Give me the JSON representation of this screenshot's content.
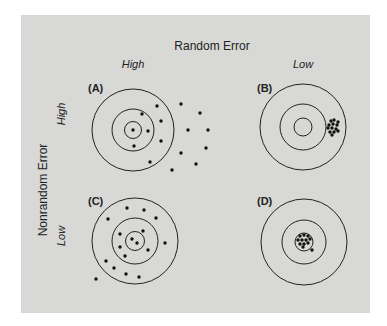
{
  "figure": {
    "column_header": "Random Error",
    "row_header": "Nonrandom Error",
    "columns": [
      {
        "label": "High",
        "x": 133,
        "y": 67
      },
      {
        "label": "Low",
        "x": 303,
        "y": 67
      }
    ],
    "rows": [
      {
        "label": "High",
        "x": 62,
        "y": 114
      },
      {
        "label": "Low",
        "x": 62,
        "y": 236
      }
    ],
    "colors": {
      "background": "#d8d8d6",
      "ink": "#222222"
    },
    "panels": [
      {
        "id": "A",
        "label": "(A)",
        "label_x": 88,
        "label_y": 92,
        "cx": 133,
        "cy": 130,
        "radii": [
          41,
          21,
          8.5
        ],
        "dots": [
          [
            157,
            106
          ],
          [
            181,
            104
          ],
          [
            142,
            114
          ],
          [
            200,
            113
          ],
          [
            161,
            121
          ],
          [
            133,
            130
          ],
          [
            148,
            131
          ],
          [
            188,
            130
          ],
          [
            208,
            130
          ],
          [
            161,
            141
          ],
          [
            134,
            146
          ],
          [
            206,
            148
          ],
          [
            181,
            153
          ],
          [
            150,
            162
          ],
          [
            196,
            164
          ],
          [
            172,
            170
          ]
        ]
      },
      {
        "id": "B",
        "label": "(B)",
        "label_x": 257,
        "label_y": 92,
        "cx": 303,
        "cy": 127,
        "radii": [
          43,
          23,
          9
        ],
        "dots": [
          [
            331,
            121
          ],
          [
            334,
            120
          ],
          [
            338,
            122
          ],
          [
            329,
            125
          ],
          [
            333,
            124
          ],
          [
            337,
            125
          ],
          [
            328,
            128
          ],
          [
            332,
            128
          ],
          [
            336,
            129
          ],
          [
            330,
            132
          ],
          [
            334,
            132
          ],
          [
            338,
            131
          ],
          [
            332,
            135
          ]
        ]
      },
      {
        "id": "C",
        "label": "(C)",
        "label_x": 88,
        "label_y": 205,
        "cx": 135,
        "cy": 241,
        "radii": [
          43,
          23,
          9.5
        ],
        "dots": [
          [
            127,
            208
          ],
          [
            144,
            210
          ],
          [
            108,
            219
          ],
          [
            156,
            218
          ],
          [
            143,
            231
          ],
          [
            120,
            234
          ],
          [
            132,
            239
          ],
          [
            137,
            243
          ],
          [
            165,
            243
          ],
          [
            120,
            247
          ],
          [
            148,
            250
          ],
          [
            125,
            256
          ],
          [
            106,
            261
          ],
          [
            114,
            268
          ],
          [
            126,
            274
          ],
          [
            139,
            277
          ],
          [
            96,
            279
          ]
        ]
      },
      {
        "id": "D",
        "label": "(D)",
        "label_x": 257,
        "label_y": 205,
        "cx": 304,
        "cy": 242,
        "radii": [
          43,
          22,
          9
        ],
        "dots": [
          [
            300,
            236
          ],
          [
            304,
            235
          ],
          [
            308,
            236
          ],
          [
            298,
            240
          ],
          [
            302,
            240
          ],
          [
            306,
            240
          ],
          [
            310,
            239
          ],
          [
            300,
            244
          ],
          [
            304,
            244
          ],
          [
            308,
            243
          ],
          [
            303,
            247
          ],
          [
            312,
            250
          ]
        ]
      }
    ]
  }
}
